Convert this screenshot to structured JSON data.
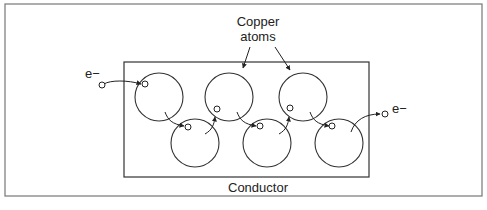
{
  "diagram": {
    "title_label_line1": "Copper",
    "title_label_line2": "atoms",
    "container_label": "Conductor",
    "electron_in_label": "e−",
    "electron_out_label": "e−",
    "colors": {
      "stroke": "#333333",
      "frame": "#777777",
      "text": "#222222",
      "background": "#ffffff"
    },
    "atoms": [
      {
        "id": "atom-1",
        "row": "top",
        "cx": 159,
        "cy": 97
      },
      {
        "id": "atom-2",
        "row": "bottom",
        "cx": 195,
        "cy": 143
      },
      {
        "id": "atom-3",
        "row": "top",
        "cx": 229,
        "cy": 97
      },
      {
        "id": "atom-4",
        "row": "bottom",
        "cx": 267,
        "cy": 143
      },
      {
        "id": "atom-5",
        "row": "top",
        "cx": 303,
        "cy": 97
      },
      {
        "id": "atom-6",
        "row": "bottom",
        "cx": 339,
        "cy": 143
      }
    ],
    "atom_radius": 24
  }
}
